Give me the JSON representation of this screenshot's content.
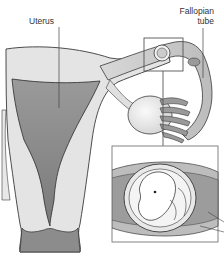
{
  "figure": {
    "labels": {
      "uterus": "Uterus",
      "fallopian_tube_line1": "Fallopian",
      "fallopian_tube_line2": "tube"
    },
    "colors": {
      "outline": "#3a3a3a",
      "tissue_light": "#e4e4e4",
      "tissue_mid": "#b4b4b4",
      "cavity_dark": "#8a8a8a",
      "inset_frame": "#555555",
      "background": "#ffffff"
    }
  }
}
